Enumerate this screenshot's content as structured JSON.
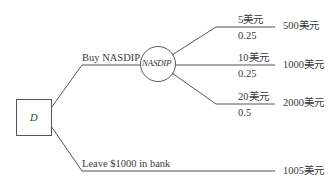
{
  "diagram": {
    "type": "decision-tree",
    "decision_node": {
      "label": "D"
    },
    "chance_node": {
      "label": "NASDIP"
    },
    "branches": {
      "buy": {
        "label": "Buy NASDIP"
      },
      "bank": {
        "label": "Leave $1000 in bank",
        "payoff": "1005美元"
      }
    },
    "outcomes": [
      {
        "price": "5美元",
        "probability": "0.25",
        "payoff": "500美元"
      },
      {
        "price": "10美元",
        "probability": "0.25",
        "payoff": "1000美元"
      },
      {
        "price": "20美元",
        "probability": "0.5",
        "payoff": "2000美元"
      }
    ],
    "colors": {
      "line": "#555555",
      "text": "#3a3a3a",
      "background": "#ffffff"
    }
  }
}
